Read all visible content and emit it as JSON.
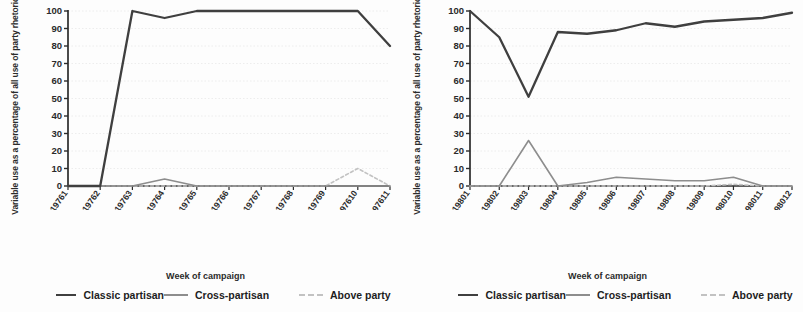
{
  "figure": {
    "background": "#fdfdfd",
    "series_colors": {
      "classic_partisan": "#3f3f3f",
      "cross_partisan": "#8d8d8d",
      "above_party": "#c2c2c2"
    },
    "gridline_color": "#e8e8e8",
    "axis_color": "#2b2b2b"
  },
  "legend": {
    "items": [
      {
        "label": "Classic partisan",
        "swatch": "solid-dark-line-swatch"
      },
      {
        "label": "Cross-partisan",
        "swatch": "solid-gray-line-swatch"
      },
      {
        "label": "Above party",
        "swatch": "dashed-light-line-swatch"
      }
    ]
  },
  "chart_data": [
    {
      "type": "line",
      "title": "",
      "panel": "left",
      "xlabel": "Week of campaign",
      "ylabel": "Variable use as a percentage of all use of party rhetoric",
      "ylim": [
        0,
        100
      ],
      "yticks": [
        0,
        10,
        20,
        30,
        40,
        50,
        60,
        70,
        80,
        90,
        100
      ],
      "grid": true,
      "legend_position": "bottom",
      "categories": [
        "CARTER19761",
        "CARTER19762",
        "CARTER19763",
        "CARTER19764",
        "CARTER19765",
        "CARTER19766",
        "CARTER19767",
        "CARTER19768",
        "CARTER19769",
        "CARTER197610",
        "CARTER197611"
      ],
      "series": [
        {
          "name": "Classic partisan",
          "color": "#3f3f3f",
          "values": [
            0,
            0,
            100,
            96,
            100,
            100,
            100,
            100,
            100,
            100,
            80
          ]
        },
        {
          "name": "Cross-partisan",
          "color": "#8d8d8d",
          "values": [
            0,
            0,
            0,
            4,
            0,
            0,
            0,
            0,
            0,
            0,
            0
          ]
        },
        {
          "name": "Above party",
          "color": "#c2c2c2",
          "values": [
            0,
            0,
            0,
            0,
            0,
            0,
            0,
            0,
            0,
            10,
            0
          ]
        }
      ]
    },
    {
      "type": "line",
      "title": "",
      "panel": "right",
      "xlabel": "Week of campaign",
      "ylabel": "Variable use as a percentage of all use of party rhetoric",
      "ylim": [
        0,
        100
      ],
      "yticks": [
        0,
        10,
        20,
        30,
        40,
        50,
        60,
        70,
        80,
        90,
        100
      ],
      "grid": true,
      "legend_position": "bottom",
      "categories": [
        "CARTER19801",
        "CARTER19802",
        "CARTER19803",
        "CARTER19804",
        "CARTER19805",
        "CARTER19806",
        "CARTER19807",
        "CARTER19808",
        "CARTER19809",
        "CARTER198010",
        "CARTER198011",
        "CARTER198012"
      ],
      "series": [
        {
          "name": "Classic partisan",
          "color": "#3f3f3f",
          "values": [
            100,
            85,
            51,
            88,
            87,
            89,
            93,
            91,
            94,
            95,
            96,
            99
          ]
        },
        {
          "name": "Cross-partisan",
          "color": "#8d8d8d",
          "values": [
            0,
            0,
            26,
            0,
            2,
            5,
            4,
            3,
            3,
            5,
            0,
            0
          ]
        },
        {
          "name": "Above party",
          "color": "#c2c2c2",
          "values": [
            0,
            0,
            0,
            0,
            0,
            0,
            0,
            0,
            0,
            1,
            0,
            0
          ]
        }
      ]
    }
  ]
}
